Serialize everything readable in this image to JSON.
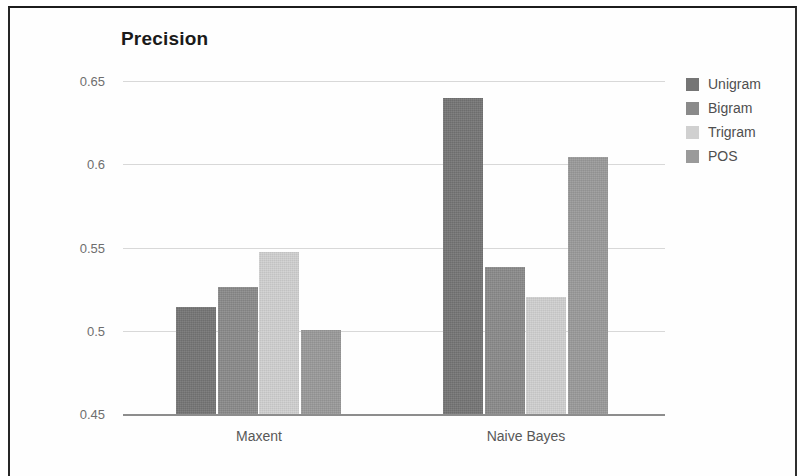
{
  "chart_data": {
    "type": "bar",
    "title": "Precision",
    "xlabel": "",
    "ylabel": "",
    "ylim": [
      0.45,
      0.65
    ],
    "yticks": [
      "0.65",
      "0.6",
      "0.55",
      "0.5",
      "0.45"
    ],
    "ytick_values": [
      0.65,
      0.6,
      0.55,
      0.5,
      0.45
    ],
    "grid": true,
    "legend_position": "right",
    "categories": [
      "Maxent",
      "Naive Bayes"
    ],
    "series": [
      {
        "name": "Unigram",
        "color": "#757575",
        "values": [
          0.5145,
          0.6395
        ]
      },
      {
        "name": "Bigram",
        "color": "#8a8a8a",
        "values": [
          0.5265,
          0.5385
        ]
      },
      {
        "name": "Trigram",
        "color": "#d0d0d0",
        "values": [
          0.5475,
          0.5205
        ]
      },
      {
        "name": "POS",
        "color": "#9a9a9a",
        "values": [
          0.5005,
          0.6045
        ]
      }
    ]
  },
  "legend": {
    "items": [
      {
        "label": "Unigram",
        "color": "#757575"
      },
      {
        "label": "Bigram",
        "color": "#8a8a8a"
      },
      {
        "label": "Trigram",
        "color": "#d0d0d0"
      },
      {
        "label": "POS",
        "color": "#9a9a9a"
      }
    ]
  },
  "axes": {
    "y_labels": [
      "0.65",
      "0.6",
      "0.55",
      "0.5",
      "0.45"
    ],
    "x_labels": [
      "Maxent",
      "Naive Bayes"
    ]
  },
  "colors": {
    "gridline": "#d8d8d8",
    "axis": "#8d8d8d",
    "tick_text": "#6e6e6e",
    "title_text": "#1a1a1a",
    "page_border": "#262626"
  }
}
